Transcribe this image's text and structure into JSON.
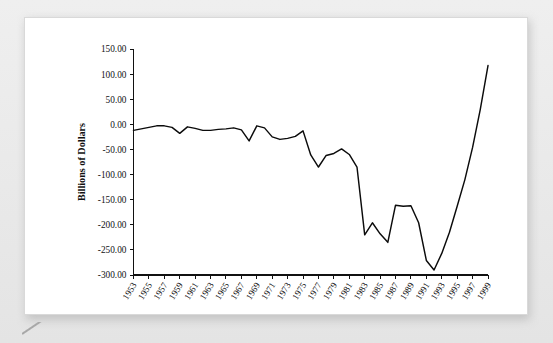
{
  "figure": {
    "background_color": "#e9e9e9",
    "card_color": "#ffffff",
    "line_color": "#0b0b0b"
  },
  "chart_data": {
    "type": "line",
    "title": "",
    "subtitle": "",
    "xlabel": "",
    "ylabel": "Billions of Dollars",
    "ylim": [
      -300,
      150
    ],
    "xlim": [
      1953,
      1999
    ],
    "grid": false,
    "legend": null,
    "y_ticks": [
      150,
      100,
      50,
      0,
      -50,
      -100,
      -150,
      -200,
      -250,
      -300
    ],
    "y_tick_labels": [
      "150.00",
      "100.00",
      "50.00",
      "0.00",
      "-50.00",
      "-100.00",
      "-150.00",
      "-200.00",
      "-250.00",
      "-300.00"
    ],
    "x_tick_labels": [
      "1953",
      "1955",
      "1957",
      "1959",
      "1961",
      "1963",
      "1965",
      "1967",
      "1969",
      "1971",
      "1973",
      "1975",
      "1977",
      "1979",
      "1981",
      "1983",
      "1985",
      "1987",
      "1989",
      "1991",
      "1993",
      "1995",
      "1997",
      "1999"
    ],
    "x": [
      1953,
      1954,
      1955,
      1956,
      1957,
      1958,
      1959,
      1960,
      1961,
      1962,
      1963,
      1964,
      1965,
      1966,
      1967,
      1968,
      1969,
      1970,
      1971,
      1972,
      1973,
      1974,
      1975,
      1976,
      1977,
      1978,
      1979,
      1980,
      1981,
      1982,
      1983,
      1984,
      1985,
      1986,
      1987,
      1988,
      1989,
      1990,
      1991,
      1992,
      1993,
      1994,
      1995,
      1996,
      1997,
      1998,
      1999
    ],
    "series": [
      {
        "name": "Federal Budget Surplus/Deficit",
        "values": [
          -12,
          -9,
          -6,
          -3,
          -3,
          -6,
          -18,
          -5,
          -8,
          -12,
          -12,
          -10,
          -9,
          -7,
          -11,
          -33,
          -3,
          -7,
          -25,
          -30,
          -28,
          -24,
          -13,
          -61,
          -85,
          -62,
          -58,
          -49,
          -60,
          -85,
          -220,
          -196,
          -218,
          -235,
          -161,
          -163,
          -162,
          -196,
          -271,
          -290,
          -257,
          -215,
          -163,
          -110,
          -46,
          30,
          117
        ]
      }
    ]
  }
}
